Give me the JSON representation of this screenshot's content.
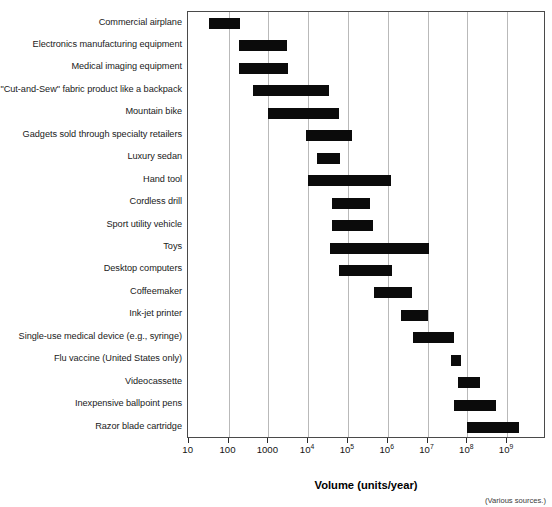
{
  "chart_data": {
    "type": "bar",
    "orientation": "horizontal-range",
    "title": "",
    "xlabel": "Volume (units/year)",
    "ylabel": "",
    "xscale": "log",
    "xlim": [
      10,
      4000000000
    ],
    "grid": true,
    "legend": "none",
    "tick_labels": [
      "10",
      "100",
      "1000",
      "10⁴",
      "10⁵",
      "10⁶",
      "10⁷",
      "10⁸",
      "10⁹"
    ],
    "tick_values": [
      10,
      100,
      1000,
      10000,
      100000,
      1000000,
      10000000,
      100000000,
      1000000000
    ],
    "tick_mantissas": [
      "10",
      "100",
      "1000",
      "10",
      "10",
      "10",
      "10",
      "10",
      "10"
    ],
    "tick_exponents": [
      "",
      "",
      "",
      "4",
      "5",
      "6",
      "7",
      "8",
      "9"
    ],
    "bar_color": "#0b0b0b",
    "gridline_color": "#b9b9b9",
    "axis_color": "#4a4a4a",
    "source_note": "(Various sources.)",
    "categories": [
      "Commercial airplane",
      "Electronics manufacturing equipment",
      "Medical imaging equipment",
      "\"Cut-and-Sew\" fabric product like a backpack",
      "Mountain bike",
      "Gadgets sold through specialty retailers",
      "Luxury sedan",
      "Hand tool",
      "Cordless drill",
      "Sport utility vehicle",
      "Toys",
      "Desktop computers",
      "Coffeemaker",
      "Ink-jet printer",
      "Single-use medical device (e.g., syringe)",
      "Flu vaccine (United States only)",
      "Videocassette",
      "Inexpensive ballpoint pens",
      "Razor blade cartridge"
    ],
    "ranges": [
      {
        "label": "Commercial airplane",
        "low": 33,
        "high": 195
      },
      {
        "label": "Electronics manufacturing equipment",
        "low": 185,
        "high": 3000
      },
      {
        "label": "Medical imaging equipment",
        "low": 180,
        "high": 3100
      },
      {
        "label": "\"Cut-and-Sew\" fabric product like a backpack",
        "low": 420,
        "high": 34000
      },
      {
        "label": "Mountain bike",
        "low": 1000,
        "high": 59000
      },
      {
        "label": "Gadgets sold through specialty retailers",
        "low": 9000,
        "high": 130000
      },
      {
        "label": "Luxury sedan",
        "low": 17000,
        "high": 62000
      },
      {
        "label": "Hand tool",
        "low": 10000,
        "high": 1200000
      },
      {
        "label": "Cordless drill",
        "low": 40000,
        "high": 360000
      },
      {
        "label": "Sport utility vehicle",
        "low": 40000,
        "high": 440000
      },
      {
        "label": "Toys",
        "low": 35000,
        "high": 11000000
      },
      {
        "label": "Desktop computers",
        "low": 60000,
        "high": 1250000
      },
      {
        "label": "Coffeemaker",
        "low": 440000,
        "high": 4000000
      },
      {
        "label": "Ink-jet printer",
        "low": 2200000,
        "high": 10500000
      },
      {
        "label": "Single-use medical device (e.g., syringe)",
        "low": 4200000,
        "high": 46000000
      },
      {
        "label": "Flu vaccine (United States only)",
        "low": 38000000,
        "high": 70000000
      },
      {
        "label": "Videocassette",
        "low": 58000000,
        "high": 210000000
      },
      {
        "label": "Inexpensive ballpoint pens",
        "low": 46000000,
        "high": 530000000
      },
      {
        "label": "Razor blade cartridge",
        "low": 100000000,
        "high": 2000000000
      }
    ]
  }
}
